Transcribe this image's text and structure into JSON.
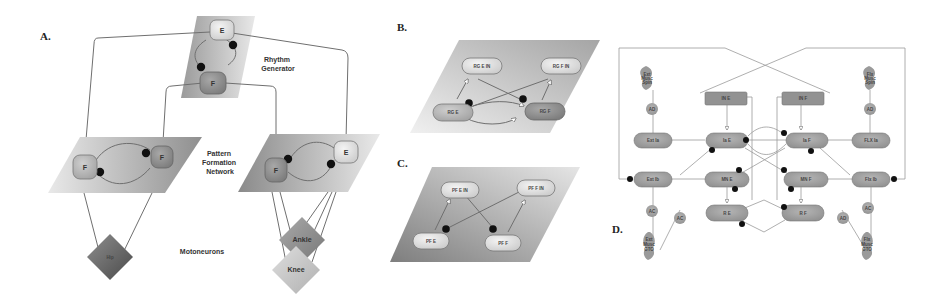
{
  "figure": {
    "panels": {
      "A": {
        "label": "A.",
        "annotations": {
          "rhythm_generator": [
            "Rhythm",
            "Generator"
          ],
          "pattern_formation": [
            "Pattern",
            "Formation",
            "Network"
          ],
          "motoneurons": "Motoneurons"
        },
        "rg_nodes": {
          "E": "E",
          "F": "F"
        },
        "pf_left_nodes": {
          "F1": "F",
          "F2": "F"
        },
        "pf_right_nodes": {
          "F": "F",
          "E": "E"
        },
        "motoneurons": {
          "hip": "Hip",
          "ankle": "Ankle",
          "knee": "Knee"
        }
      },
      "B": {
        "label": "B.",
        "nodes": {
          "rg_e_in": "RG E IN",
          "rg_f_in": "RG F IN",
          "rg_e": "RG E",
          "rg_f": "RG F"
        }
      },
      "C": {
        "label": "C.",
        "nodes": {
          "pf_e_in": "PF E IN",
          "pf_f_in": "PF F IN",
          "pf_e": "PF E",
          "pf_f": "PF F"
        }
      },
      "D": {
        "label": "D.",
        "nodes": {
          "inh_e": "IN E",
          "inh_f": "IN F",
          "ext_ia": "Ext Ia",
          "ia_e": "Ia E",
          "ia_f": "Ia F",
          "flx_ia": "FLX Ia",
          "ext_ib": "Ext Ib",
          "mn_e": "MN E",
          "mn_f": "MN F",
          "flx_ib": "Flx Ib",
          "r_e": "R E",
          "r_f": "R F",
          "ad": "AD",
          "ac": "AC",
          "muscle_top_left": [
            "Ext",
            "Musc",
            "Spin"
          ],
          "muscle_top_right": [
            "Flx",
            "Musc",
            "Spin"
          ],
          "muscle_bottom_left": [
            "Ext",
            "Musc",
            "GTO"
          ],
          "muscle_bottom_right": [
            "Flx",
            "Musc",
            "GTO"
          ]
        }
      }
    },
    "colors": {
      "plane_light": "#e6e6e6",
      "plane_mid": "#bdbdbd",
      "plane_dark": "#8a8a8a",
      "node_light": "#dcdcdc",
      "node_dark": "#8c8c8c",
      "inhibit_dot": "#111111",
      "edge": "#6f6f6f"
    }
  }
}
